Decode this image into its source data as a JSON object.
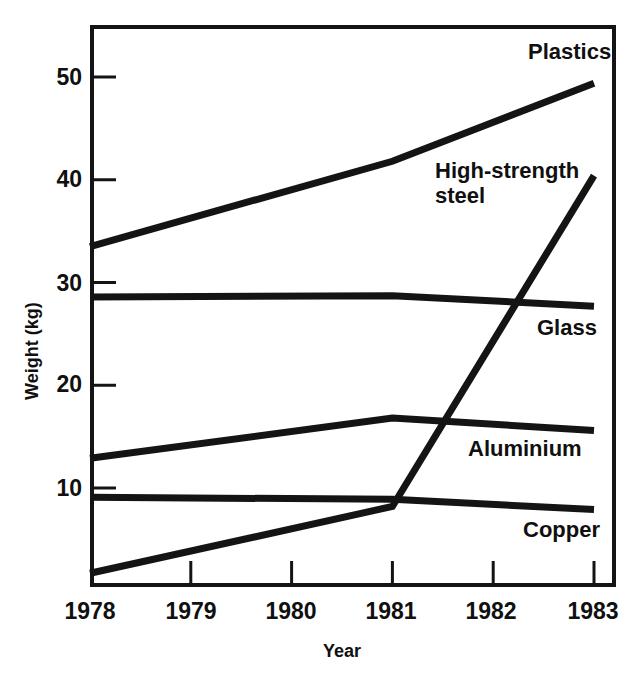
{
  "chart_data": {
    "type": "line",
    "title": "",
    "xlabel": "Year",
    "ylabel": "Weight (kg)",
    "x": [
      1978,
      1979,
      1980,
      1981,
      1982,
      1983
    ],
    "xtick_labels": [
      "1978",
      "1979",
      "1980",
      "1981",
      "1982",
      "1983"
    ],
    "ytick_labels": [
      "10",
      "20",
      "30",
      "40",
      "50"
    ],
    "yticks": [
      10,
      20,
      30,
      40,
      50
    ],
    "xlim": [
      1978,
      1983
    ],
    "ylim": [
      0.3,
      55
    ],
    "grid": false,
    "legend": "inline-labels-right",
    "line_color": "#141414",
    "background": "#ffffff",
    "series": [
      {
        "name": "Plastics",
        "label": "Plastics",
        "x": [
          1978,
          1981,
          1983
        ],
        "values": [
          33.5,
          41.8,
          49.4
        ]
      },
      {
        "name": "High-strength steel",
        "label": "High-strength\nsteel",
        "x": [
          1978,
          1981,
          1983
        ],
        "values": [
          1.7,
          8.2,
          40.4
        ]
      },
      {
        "name": "Glass",
        "label": "Glass",
        "x": [
          1978,
          1981,
          1983
        ],
        "values": [
          28.6,
          28.7,
          27.7
        ]
      },
      {
        "name": "Aluminium",
        "label": "Aluminium",
        "x": [
          1978,
          1981,
          1983
        ],
        "values": [
          12.9,
          16.8,
          15.6
        ]
      },
      {
        "name": "Copper",
        "label": "Copper",
        "x": [
          1978,
          1981,
          1983
        ],
        "values": [
          9.1,
          8.9,
          7.9
        ]
      }
    ],
    "series_label_positions": [
      {
        "name": "Plastics",
        "left": 528,
        "top": 40
      },
      {
        "name": "High-strength steel",
        "left": 435,
        "top": 159
      },
      {
        "name": "Glass",
        "left": 537,
        "top": 316
      },
      {
        "name": "Aluminium",
        "left": 468,
        "top": 437
      },
      {
        "name": "Copper",
        "left": 523,
        "top": 518
      }
    ]
  }
}
